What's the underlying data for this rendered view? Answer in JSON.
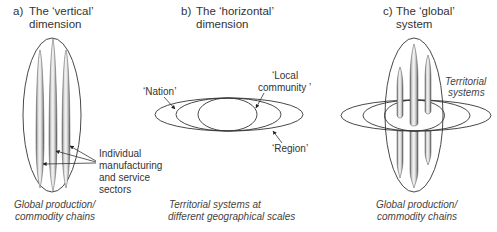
{
  "panels": [
    {
      "id": "a",
      "letter": "a)",
      "title_line1": "The ‘vertical’",
      "title_line2": "dimension",
      "annotation": {
        "lines": [
          "Individual",
          "manufacturing",
          "and service",
          "sectors"
        ]
      },
      "caption_line1": "Global production/",
      "caption_line2": "commodity chains"
    },
    {
      "id": "b",
      "letter": "b)",
      "title_line1": "The ‘horizontal’",
      "title_line2": "dimension",
      "labels": {
        "nation": "‘Nation’",
        "local_line1": "‘Local",
        "local_line2": "community ’",
        "region": "‘Region’"
      },
      "caption_line1": "Territorial systems at",
      "caption_line2": "different geographical scales"
    },
    {
      "id": "c",
      "letter": "c)",
      "title_line1": "The ‘global’",
      "title_line2": "system",
      "labels": {
        "territorial_line1": "Territorial",
        "territorial_line2": "systems"
      },
      "caption_line1": "Global production/",
      "caption_line2": "commodity chains"
    }
  ],
  "colors": {
    "stroke": "#333333",
    "column_light": "#f2f2f2",
    "column_dark": "#7a7a7a"
  }
}
